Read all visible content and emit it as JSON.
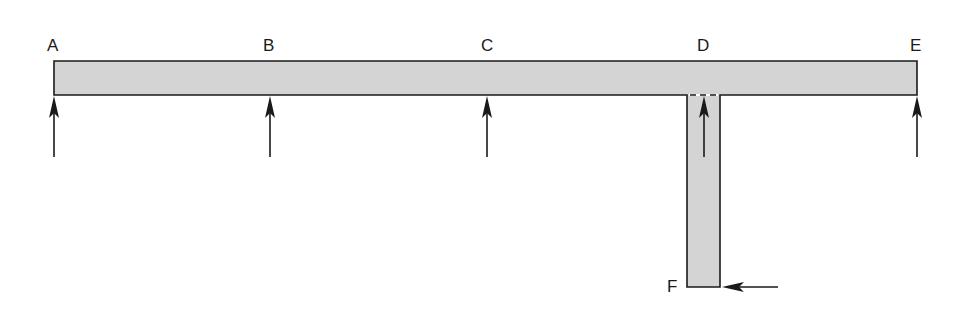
{
  "diagram": {
    "type": "structural-frame",
    "colors": {
      "member_fill": "#d4d4d4",
      "stroke": "#1a1a1a",
      "background": "#ffffff"
    },
    "beam": {
      "x1": 54,
      "x2": 917,
      "y_top": 61,
      "y_bottom": 95
    },
    "stem": {
      "x1": 687,
      "x2": 720,
      "y_top": 95,
      "y_bottom": 287
    },
    "points": [
      {
        "id": "A",
        "label": "A",
        "x": 54,
        "label_x": 47,
        "label_y": 51
      },
      {
        "id": "B",
        "label": "B",
        "x": 270,
        "label_x": 263,
        "label_y": 51
      },
      {
        "id": "C",
        "label": "C",
        "x": 487,
        "label_x": 481,
        "label_y": 51
      },
      {
        "id": "D",
        "label": "D",
        "x": 704,
        "label_x": 697,
        "label_y": 51
      },
      {
        "id": "E",
        "label": "E",
        "x": 917,
        "label_x": 910,
        "label_y": 51
      },
      {
        "id": "F",
        "label": "F",
        "x": 687,
        "label_x": 667,
        "label_y": 292
      }
    ],
    "forces": [
      {
        "at": "A",
        "direction": "up",
        "x": 54,
        "tip_y": 96,
        "tail_y": 157
      },
      {
        "at": "B",
        "direction": "up",
        "x": 270,
        "tip_y": 96,
        "tail_y": 157
      },
      {
        "at": "C",
        "direction": "up",
        "x": 487,
        "tip_y": 96,
        "tail_y": 157
      },
      {
        "at": "D",
        "direction": "up",
        "x": 704,
        "tip_y": 96,
        "tail_y": 157
      },
      {
        "at": "E",
        "direction": "up",
        "x": 917,
        "tip_y": 96,
        "tail_y": 157
      },
      {
        "at": "F",
        "direction": "left",
        "y": 287,
        "tip_x": 722,
        "tail_x": 778
      }
    ]
  }
}
